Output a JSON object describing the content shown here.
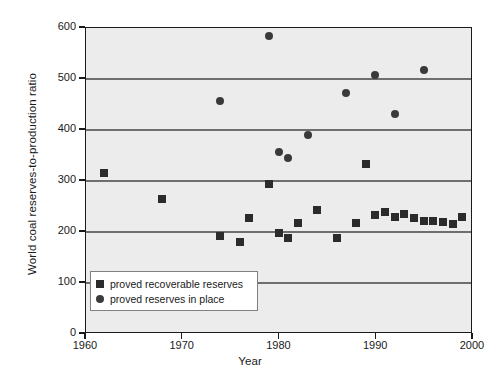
{
  "chart_data": {
    "type": "scatter",
    "title": "",
    "xlabel": "Year",
    "ylabel": "World coal reserves-to-production ratio",
    "xlim": [
      1960,
      2000
    ],
    "ylim": [
      0,
      600
    ],
    "xticks": [
      1960,
      1970,
      1980,
      1990,
      2000
    ],
    "yticks": [
      0,
      100,
      200,
      300,
      400,
      500,
      600
    ],
    "grid": "horizontal",
    "legend_position": "lower-left-inside",
    "plot_background": "#ececec",
    "marker_color": "#2b2b2b",
    "series": [
      {
        "name": "proved recoverable reserves",
        "marker": "square",
        "points": [
          {
            "x": 1962,
            "y": 313
          },
          {
            "x": 1968,
            "y": 262
          },
          {
            "x": 1974,
            "y": 190
          },
          {
            "x": 1976,
            "y": 179
          },
          {
            "x": 1977,
            "y": 226
          },
          {
            "x": 1979,
            "y": 293
          },
          {
            "x": 1980,
            "y": 197
          },
          {
            "x": 1981,
            "y": 186
          },
          {
            "x": 1982,
            "y": 215
          },
          {
            "x": 1984,
            "y": 241
          },
          {
            "x": 1986,
            "y": 187
          },
          {
            "x": 1988,
            "y": 215
          },
          {
            "x": 1989,
            "y": 332
          },
          {
            "x": 1990,
            "y": 232
          },
          {
            "x": 1991,
            "y": 238
          },
          {
            "x": 1992,
            "y": 227
          },
          {
            "x": 1993,
            "y": 233
          },
          {
            "x": 1994,
            "y": 226
          },
          {
            "x": 1995,
            "y": 220
          },
          {
            "x": 1996,
            "y": 220
          },
          {
            "x": 1997,
            "y": 218
          },
          {
            "x": 1998,
            "y": 213
          },
          {
            "x": 1999,
            "y": 228
          }
        ]
      },
      {
        "name": "proved reserves in place",
        "marker": "circle",
        "points": [
          {
            "x": 1974,
            "y": 455
          },
          {
            "x": 1979,
            "y": 583
          },
          {
            "x": 1980,
            "y": 354
          },
          {
            "x": 1981,
            "y": 344
          },
          {
            "x": 1983,
            "y": 388
          },
          {
            "x": 1987,
            "y": 471
          },
          {
            "x": 1990,
            "y": 506
          },
          {
            "x": 1992,
            "y": 430
          },
          {
            "x": 1995,
            "y": 516
          }
        ]
      }
    ]
  },
  "legend": {
    "items": [
      {
        "label": "proved recoverable reserves",
        "marker": "square"
      },
      {
        "label": "proved reserves in place",
        "marker": "circle"
      }
    ]
  }
}
